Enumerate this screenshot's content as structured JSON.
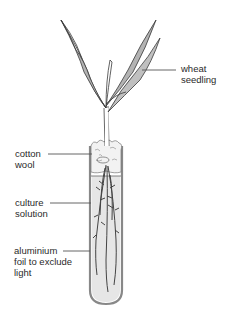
{
  "labels": {
    "wheat_seedling": "wheat\nseedling",
    "cotton_wool": "cotton\nwool",
    "culture_solution": "culture\nsolution",
    "aluminium_foil": "aluminium\nfoil to exclude\nlight"
  },
  "colors": {
    "leaf_fill": "#b3b3b3",
    "outline": "#3a3a3a",
    "solution_fill": "#e4e4e4",
    "label_line": "#555555"
  }
}
